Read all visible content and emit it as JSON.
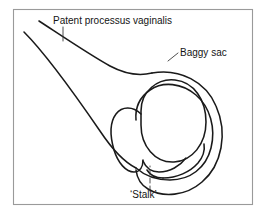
{
  "figure": {
    "domain": "diagram",
    "kind": "anatomical-line-drawing",
    "background_color": "#ffffff",
    "frame": {
      "stroke_color": "#9a9a9a",
      "x": 13,
      "y": 9,
      "width": 240,
      "height": 196
    },
    "ink_color": "#1a1a1a",
    "leader_color": "#3a3a3a"
  },
  "labels": {
    "patent_processus_vaginalis": {
      "text": "Patent processus vaginalis",
      "x": 53,
      "y": 24,
      "anchor": "start"
    },
    "baggy_sac": {
      "text": "Baggy sac",
      "x": 180,
      "y": 56,
      "anchor": "start"
    },
    "stalk": {
      "text": "‘Stalk’",
      "x": 130,
      "y": 198,
      "anchor": "start"
    }
  },
  "leaders": [
    {
      "name": "leader-patent-processus-vaginalis",
      "style": "solid",
      "path": "M 63 27 L 63 41"
    },
    {
      "name": "leader-baggy-sac",
      "style": "solid",
      "path": "M 178 53 L 168 61"
    },
    {
      "name": "leader-stalk",
      "style": "dashed",
      "path": "M 150 191 L 150 166"
    }
  ],
  "strokes": [
    {
      "name": "processus-upper-wall",
      "path": "M 39 21 C 62 36 90 55 110 66 C 125 74 140 76 152 73"
    },
    {
      "name": "processus-lower-wall",
      "path": "M 24 32 C 48 56 76 96 100 131 C 112 149 124 162 136 168"
    },
    {
      "name": "baggy-sac-outer",
      "path": "M 152 73 C 180 68 206 82 216 106 C 228 133 222 165 202 182 C 186 196 163 198 148 189 C 141 185 137 178 136 170"
    },
    {
      "name": "tunica-inner-fold",
      "path": "M 136 168 C 144 175 156 180 170 180 C 190 180 206 168 211 148 C 216 128 210 107 196 95 C 182 83 163 81 150 90 C 140 97 135 108 136 120"
    },
    {
      "name": "testis-oval",
      "path": "M 141 111 C 141 91 158 78 175 80 C 194 82 206 100 206 122 C 206 144 192 161 174 162 C 155 163 141 146 141 125 Z"
    },
    {
      "name": "epididymis-body",
      "path": "M 141 114 C 133 106 122 106 116 114 C 110 122 110 136 114 150 C 118 163 126 172 134 172 C 140 172 143 167 143 160"
    },
    {
      "name": "epididymis-lower-tail",
      "path": "M 143 161 C 146 168 152 172 159 172 C 170 172 180 166 186 158"
    },
    {
      "name": "stalk-neck-left",
      "path": "M 147 170 C 150 175 156 178 163 178"
    },
    {
      "name": "stalk-lower-loop",
      "path": "M 163 178 C 177 178 190 172 198 163 C 203 157 205 150 204 144"
    }
  ]
}
